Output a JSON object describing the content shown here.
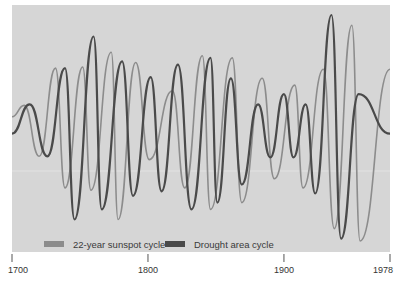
{
  "chart_data": {
    "type": "line",
    "title": "",
    "xlabel": "",
    "ylabel": "",
    "xlim": [
      1700,
      1978
    ],
    "grid": false,
    "legend_position": "bottom-left-inside",
    "x_ticks": [
      1700,
      1800,
      1900,
      1978
    ],
    "x_tick_labels": [
      "1700",
      "1800",
      "1900",
      "1978"
    ],
    "colors": {
      "panel_background": "#d6d6d6",
      "sunspot": "#8c8c8c",
      "drought": "#4a4a4a",
      "axis": "#555555"
    },
    "note": "Relative amplitude (unitless). y values are normalized: +1 = highest peak, -1 = lowest trough. Points are successive peaks/troughs.",
    "series": [
      {
        "name": "22-year sunspot cycle",
        "color": "#8c8c8c",
        "points": [
          [
            1700,
            0.1
          ],
          [
            1709,
            0.2
          ],
          [
            1720,
            -0.25
          ],
          [
            1732,
            0.53
          ],
          [
            1739,
            -0.53
          ],
          [
            1752,
            0.54
          ],
          [
            1758,
            -0.55
          ],
          [
            1773,
            0.67
          ],
          [
            1778,
            -0.81
          ],
          [
            1791,
            0.58
          ],
          [
            1801,
            -0.28
          ],
          [
            1818,
            0.33
          ],
          [
            1827,
            -0.53
          ],
          [
            1840,
            0.64
          ],
          [
            1846,
            -0.72
          ],
          [
            1862,
            0.62
          ],
          [
            1869,
            -0.66
          ],
          [
            1884,
            0.44
          ],
          [
            1893,
            -0.45
          ],
          [
            1908,
            0.38
          ],
          [
            1914,
            -0.53
          ],
          [
            1929,
            0.52
          ],
          [
            1937,
            -0.89
          ],
          [
            1950,
            0.91
          ],
          [
            1956,
            -1.0
          ],
          [
            1978,
            0.52
          ]
        ]
      },
      {
        "name": "Drought area cycle",
        "color": "#4a4a4a",
        "points": [
          [
            1700,
            -0.05
          ],
          [
            1713,
            0.21
          ],
          [
            1726,
            -0.25
          ],
          [
            1739,
            0.53
          ],
          [
            1746,
            -0.81
          ],
          [
            1760,
            0.81
          ],
          [
            1766,
            -0.72
          ],
          [
            1781,
            0.59
          ],
          [
            1789,
            -0.6
          ],
          [
            1802,
            0.45
          ],
          [
            1810,
            -0.56
          ],
          [
            1822,
            0.56
          ],
          [
            1832,
            -0.72
          ],
          [
            1846,
            0.62
          ],
          [
            1851,
            -0.66
          ],
          [
            1861,
            0.44
          ],
          [
            1869,
            -0.5
          ],
          [
            1881,
            0.21
          ],
          [
            1890,
            -0.26
          ],
          [
            1900,
            0.3
          ],
          [
            1907,
            -0.26
          ],
          [
            1916,
            0.21
          ],
          [
            1923,
            -0.58
          ],
          [
            1935,
            1.0
          ],
          [
            1942,
            -0.98
          ],
          [
            1955,
            0.3
          ],
          [
            1978,
            -0.05
          ]
        ]
      }
    ]
  },
  "legend": {
    "items": [
      {
        "label": "22-year sunspot cycle",
        "color": "#8c8c8c"
      },
      {
        "label": "Drought area cycle",
        "color": "#4a4a4a"
      }
    ]
  },
  "axis": {
    "ticks": [
      {
        "label": "1700",
        "year": 1700
      },
      {
        "label": "1800",
        "year": 1800
      },
      {
        "label": "1900",
        "year": 1900
      },
      {
        "label": "1978",
        "year": 1978
      }
    ]
  }
}
